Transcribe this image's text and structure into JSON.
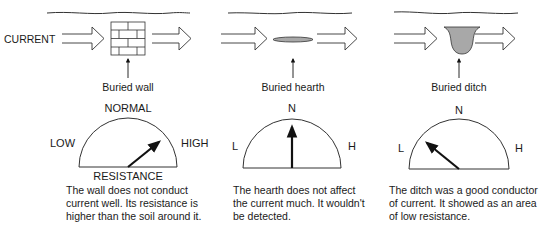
{
  "current_label": "CURRENT",
  "panels": [
    {
      "id": "wall",
      "object_label": "Buried wall",
      "gauge": {
        "top": "NORMAL",
        "left": "LOW",
        "right": "HIGH",
        "bottom": "RESISTANCE",
        "reading": "high"
      },
      "description": [
        "The wall does not conduct",
        "current well. Its resistance is",
        "higher than the soil around it."
      ]
    },
    {
      "id": "hearth",
      "object_label": "Buried hearth",
      "gauge": {
        "top": "N",
        "left": "L",
        "right": "H",
        "bottom": "",
        "reading": "normal"
      },
      "description": [
        "The hearth does not affect",
        "the current much. It wouldn't",
        "be detected."
      ]
    },
    {
      "id": "ditch",
      "object_label": "Buried ditch",
      "gauge": {
        "top": "N",
        "left": "L",
        "right": "H",
        "bottom": "",
        "reading": "low"
      },
      "description": [
        "The ditch was a good conductor",
        "of current. It showed as an area",
        "of low resistance."
      ]
    }
  ],
  "colors": {
    "ink": "#1a1a1a",
    "fill_gray": "#a8a8a8"
  }
}
